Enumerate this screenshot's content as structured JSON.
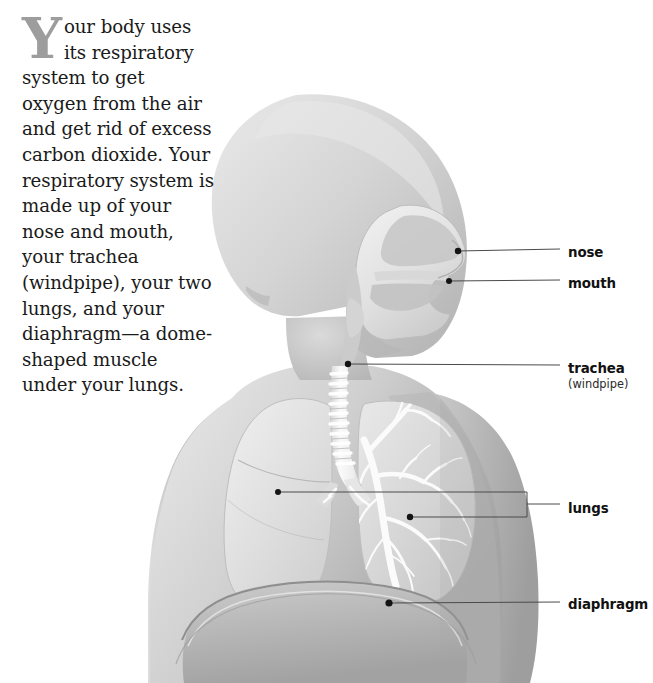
{
  "figure": {
    "body_text": {
      "drop_cap": "Y",
      "paragraph": "our body uses its respiratory system to get oxygen from the air and get rid of excess carbon dioxide. Your respiratory system is made up of your nose and mouth, your trachea (windpipe), your two lungs, and your diaphragm—a dome-shaped muscle under your lungs."
    },
    "labels": [
      {
        "id": "nose",
        "text": "nose",
        "sub": "",
        "x": 568,
        "y": 253,
        "dot_x": 458,
        "dot_y": 251,
        "connector": "line"
      },
      {
        "id": "mouth",
        "text": "mouth",
        "sub": "",
        "x": 568,
        "y": 284,
        "dot_x": 449,
        "dot_y": 281,
        "connector": "line"
      },
      {
        "id": "trachea",
        "text": "trachea",
        "sub": "(windpipe)",
        "x": 568,
        "y": 369,
        "dot_x": 348,
        "dot_y": 364,
        "connector": "line"
      },
      {
        "id": "lungs",
        "text": "lungs",
        "sub": "",
        "x": 568,
        "y": 509,
        "dot_x": 278,
        "dot_y": 492,
        "connector": "bracket"
      },
      {
        "id": "diaphragm",
        "text": "diaphragm",
        "sub": "",
        "x": 568,
        "y": 605,
        "dot_x": 389,
        "dot_y": 603,
        "connector": "line"
      }
    ],
    "lungs_bracket": {
      "upper_dot_x": 278,
      "upper_dot_y": 492,
      "lower_dot_x": 410,
      "lower_dot_y": 517,
      "bar_x": 527,
      "label_tip_x": 560
    },
    "colors": {
      "background": "#ffffff",
      "skin_light": "#dcdcdc",
      "skin_mid": "#c8c8c8",
      "skin_dark": "#a8a8a8",
      "lung_fill": "#e2e2e2",
      "airway_fill": "#f0f0f0",
      "outline": "#9a9a9a",
      "leader_line": "#4a4a4a",
      "dot": "#1a1a1a",
      "text": "#111111",
      "dropcap": "#9d9d9d"
    },
    "anatomy_parts": [
      "head profile",
      "nasal cavity",
      "oral cavity",
      "pharynx",
      "larynx",
      "trachea with cartilage rings",
      "left lung",
      "right lung",
      "bronchi",
      "bronchioles",
      "diaphragm",
      "torso",
      "shoulders",
      "arms"
    ]
  }
}
